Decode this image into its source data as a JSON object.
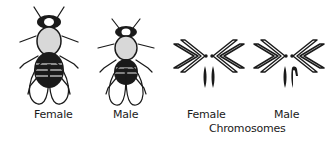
{
  "figure": {
    "flies": [
      {
        "id": "female",
        "label": "Female"
      },
      {
        "id": "male",
        "label": "Male"
      }
    ],
    "chromosomes": {
      "group_label": "Chromosomes",
      "sets": [
        {
          "id": "female",
          "label": "Female",
          "sex_chromosomes": "XX"
        },
        {
          "id": "male",
          "label": "Male",
          "sex_chromosomes": "XY"
        }
      ]
    },
    "colors": {
      "ink": "#1a1a1a",
      "background": "#ffffff",
      "thorax_stipple": "#d8d8d8"
    }
  }
}
